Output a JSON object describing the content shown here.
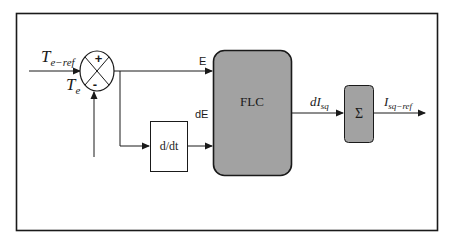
{
  "diagram": {
    "type": "block-diagram",
    "colors": {
      "frame": "#1a1a1a",
      "line": "#1a1a1a",
      "block_fill": "#a2a2a2",
      "background": "#ffffff"
    },
    "summing_junction": {
      "plus_sign": "+",
      "minus_sign": "-"
    },
    "inputs": {
      "reference": {
        "main": "T",
        "sub": "e−ref"
      },
      "feedback": {
        "main": "T",
        "sub": "e"
      }
    },
    "signals": {
      "error": "E",
      "error_derivative": "dE",
      "flc_output": {
        "main": "dI",
        "sub": "sq"
      },
      "output": {
        "main": "I",
        "sub": "sq−ref"
      }
    },
    "blocks": {
      "derivative": "d/dt",
      "flc": "FLC",
      "integrator": "Σ"
    }
  }
}
